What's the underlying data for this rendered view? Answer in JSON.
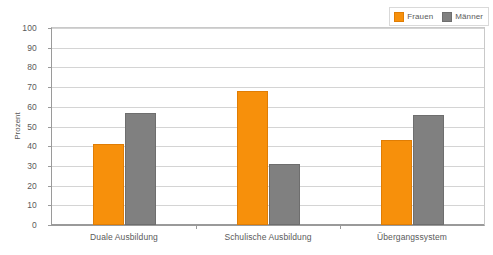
{
  "chart_data": {
    "type": "bar",
    "title": "",
    "subtitle": "",
    "xlabel": "",
    "ylabel": "Prozent",
    "ylim": [
      0,
      100
    ],
    "ytick_step": 10,
    "yticks": [
      0,
      10,
      20,
      30,
      40,
      50,
      60,
      70,
      80,
      90,
      100
    ],
    "grid": true,
    "legend_position": "top-right",
    "categories": [
      "Duale Ausbildung",
      "Schulische Ausbildung",
      "Übergangssystem"
    ],
    "series": [
      {
        "name": "Frauen",
        "color": "#F7900B",
        "values": [
          41,
          68,
          43
        ]
      },
      {
        "name": "Männer",
        "color": "#808080",
        "values": [
          57,
          31,
          56
        ]
      }
    ]
  },
  "legend": {
    "entries": [
      {
        "label": "Frauen",
        "swatch_name": "legend-swatch-frauen"
      },
      {
        "label": "Männer",
        "swatch_name": "legend-swatch-maenner"
      }
    ]
  },
  "axes": {
    "y_title": "Prozent"
  }
}
